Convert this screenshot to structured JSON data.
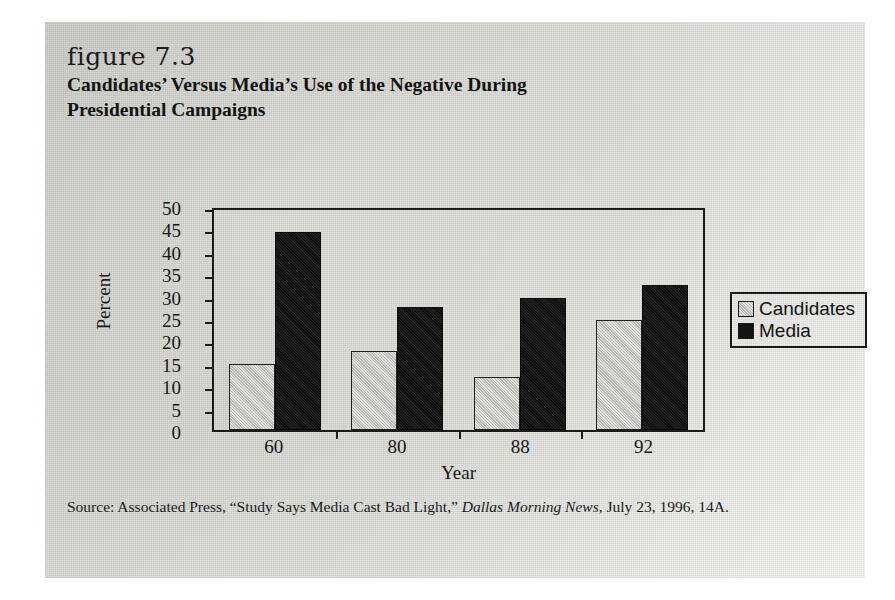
{
  "figure": {
    "label": "figure 7.3",
    "title": "Candidates’ Versus Media’s Use of the Negative During Presidential Campaigns"
  },
  "source": {
    "prefix": "Source: Associated Press, “Study Says Media Cast Bad Light,” ",
    "publication": "Dallas Morning News",
    "suffix": ", July 23, 1996, 14A."
  },
  "colors": {
    "candidates": "#c3c3bf",
    "media": "#141414",
    "axis": "#1a1a1a",
    "page": "#d4d4cf"
  },
  "chart_data": {
    "type": "bar",
    "title": "Candidates’ Versus Media’s Use of the Negative During Presidential Campaigns",
    "categories": [
      "60",
      "80",
      "88",
      "92"
    ],
    "series": [
      {
        "name": "Candidates",
        "values": [
          15,
          18,
          12,
          25
        ],
        "color": "#c3c3bf"
      },
      {
        "name": "Media",
        "values": [
          45,
          28,
          30,
          33
        ],
        "color": "#141414"
      }
    ],
    "xlabel": "Year",
    "ylabel": "Percent",
    "ylim": [
      0,
      50
    ],
    "yticks": [
      0,
      5,
      10,
      15,
      20,
      25,
      30,
      35,
      40,
      45,
      50
    ],
    "ytick_labels": [
      "0",
      "5",
      "10",
      "15",
      "20",
      "25",
      "30",
      "35",
      "40",
      "45",
      "50"
    ],
    "grid": false,
    "legend_position": "right"
  }
}
